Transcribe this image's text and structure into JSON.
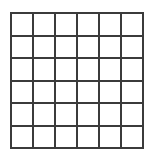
{
  "figure": {
    "name": "empty-square-grid",
    "type": "grid-diagram",
    "title": "",
    "caption": "",
    "rows": 6,
    "columns": 6,
    "total_cells": 36,
    "horizontal_lines": 7,
    "vertical_lines": 7,
    "cells_contain_text": false,
    "cell_text": "",
    "geometry": {
      "canvas_width_px": 152,
      "canvas_height_px": 157,
      "grid_left_px": 10,
      "grid_top_px": 12,
      "grid_width_px": 134,
      "grid_height_px": 137,
      "cell_width_px": 21,
      "cell_height_px": 21.5,
      "line_thickness_px": 2
    },
    "colors": {
      "background": "#ffffff",
      "grid_line": "#3b3b3b",
      "cell_fill": "#ffffff",
      "border": "#3b3b3b"
    }
  },
  "cells": [
    {
      "row": 1,
      "col": 1,
      "label": ""
    },
    {
      "row": 1,
      "col": 2,
      "label": ""
    },
    {
      "row": 1,
      "col": 3,
      "label": ""
    },
    {
      "row": 1,
      "col": 4,
      "label": ""
    },
    {
      "row": 1,
      "col": 5,
      "label": ""
    },
    {
      "row": 1,
      "col": 6,
      "label": ""
    },
    {
      "row": 2,
      "col": 1,
      "label": ""
    },
    {
      "row": 2,
      "col": 2,
      "label": ""
    },
    {
      "row": 2,
      "col": 3,
      "label": ""
    },
    {
      "row": 2,
      "col": 4,
      "label": ""
    },
    {
      "row": 2,
      "col": 5,
      "label": ""
    },
    {
      "row": 2,
      "col": 6,
      "label": ""
    },
    {
      "row": 3,
      "col": 1,
      "label": ""
    },
    {
      "row": 3,
      "col": 2,
      "label": ""
    },
    {
      "row": 3,
      "col": 3,
      "label": ""
    },
    {
      "row": 3,
      "col": 4,
      "label": ""
    },
    {
      "row": 3,
      "col": 5,
      "label": ""
    },
    {
      "row": 3,
      "col": 6,
      "label": ""
    },
    {
      "row": 4,
      "col": 1,
      "label": ""
    },
    {
      "row": 4,
      "col": 2,
      "label": ""
    },
    {
      "row": 4,
      "col": 3,
      "label": ""
    },
    {
      "row": 4,
      "col": 4,
      "label": ""
    },
    {
      "row": 4,
      "col": 5,
      "label": ""
    },
    {
      "row": 4,
      "col": 6,
      "label": ""
    },
    {
      "row": 5,
      "col": 1,
      "label": ""
    },
    {
      "row": 5,
      "col": 2,
      "label": ""
    },
    {
      "row": 5,
      "col": 3,
      "label": ""
    },
    {
      "row": 5,
      "col": 4,
      "label": ""
    },
    {
      "row": 5,
      "col": 5,
      "label": ""
    },
    {
      "row": 5,
      "col": 6,
      "label": ""
    },
    {
      "row": 6,
      "col": 1,
      "label": ""
    },
    {
      "row": 6,
      "col": 2,
      "label": ""
    },
    {
      "row": 6,
      "col": 3,
      "label": ""
    },
    {
      "row": 6,
      "col": 4,
      "label": ""
    },
    {
      "row": 6,
      "col": 5,
      "label": ""
    },
    {
      "row": 6,
      "col": 6,
      "label": ""
    }
  ]
}
